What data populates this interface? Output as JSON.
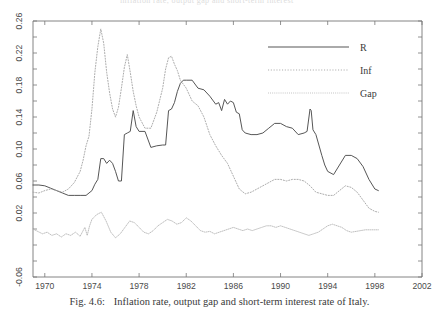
{
  "figure": {
    "caption_number": "Fig. 4.6:",
    "caption_text": "Inflation rate, output gap and short-term interest rate of Italy.",
    "top_bleed_text": "inflation rate, output gap and short-term interest"
  },
  "chart_data": {
    "type": "line",
    "title": "",
    "xlabel": "",
    "ylabel": "",
    "xlim": [
      1969,
      2002
    ],
    "ylim": [
      -0.06,
      0.26
    ],
    "grid": false,
    "legend_position": "top-right",
    "xticks": [
      1970,
      1974,
      1978,
      1982,
      1986,
      1990,
      1994,
      1998,
      2002
    ],
    "xtick_labels": [
      "1970",
      "1974",
      "1978",
      "1982",
      "1986",
      "1990",
      "1994",
      "1998",
      "2002"
    ],
    "yticks": [
      -0.06,
      -0.04,
      -0.02,
      0.0,
      0.02,
      0.04,
      0.06,
      0.08,
      0.1,
      0.12,
      0.14,
      0.16,
      0.18,
      0.2,
      0.22,
      0.24,
      0.26
    ],
    "ytick_labels": [
      "-0.06",
      "",
      "0.02",
      "",
      "0.06",
      "",
      "0.10",
      "",
      "0.14",
      "",
      "0.18",
      "",
      "0.22",
      "",
      "0.26"
    ],
    "ytick_labeled": [
      -0.06,
      0.02,
      0.06,
      0.1,
      0.14,
      0.18,
      0.22,
      0.26
    ],
    "series": [
      {
        "name": "R",
        "style": "solid",
        "color": "#4d4d4d",
        "x": [
          1969.0,
          1969.5,
          1970.0,
          1970.5,
          1971.0,
          1971.5,
          1972.0,
          1972.5,
          1973.0,
          1973.5,
          1974.0,
          1974.25,
          1974.5,
          1974.75,
          1975.0,
          1975.25,
          1975.5,
          1975.75,
          1976.0,
          1976.25,
          1976.5,
          1976.75,
          1977.0,
          1977.25,
          1977.5,
          1977.75,
          1978.0,
          1978.5,
          1979.0,
          1979.5,
          1980.0,
          1980.25,
          1980.5,
          1980.75,
          1981.0,
          1981.25,
          1981.5,
          1981.75,
          1982.0,
          1982.5,
          1983.0,
          1983.5,
          1984.0,
          1984.5,
          1984.75,
          1985.0,
          1985.25,
          1985.5,
          1985.75,
          1986.0,
          1986.25,
          1986.5,
          1986.75,
          1987.0,
          1987.5,
          1988.0,
          1988.5,
          1989.0,
          1989.5,
          1990.0,
          1990.5,
          1991.0,
          1991.5,
          1992.0,
          1992.25,
          1992.5,
          1992.6,
          1992.75,
          1993.0,
          1993.25,
          1993.5,
          1993.75,
          1994.0,
          1994.5,
          1995.0,
          1995.5,
          1996.0,
          1996.5,
          1997.0,
          1997.5,
          1998.0,
          1998.3
        ],
        "y": [
          0.055,
          0.055,
          0.054,
          0.051,
          0.048,
          0.045,
          0.042,
          0.042,
          0.042,
          0.042,
          0.048,
          0.056,
          0.062,
          0.088,
          0.088,
          0.082,
          0.086,
          0.082,
          0.072,
          0.06,
          0.06,
          0.118,
          0.12,
          0.122,
          0.148,
          0.128,
          0.122,
          0.122,
          0.102,
          0.104,
          0.105,
          0.105,
          0.148,
          0.15,
          0.158,
          0.172,
          0.182,
          0.186,
          0.186,
          0.186,
          0.176,
          0.174,
          0.166,
          0.156,
          0.158,
          0.148,
          0.162,
          0.156,
          0.16,
          0.158,
          0.146,
          0.144,
          0.124,
          0.12,
          0.118,
          0.118,
          0.12,
          0.126,
          0.132,
          0.132,
          0.128,
          0.126,
          0.118,
          0.12,
          0.122,
          0.15,
          0.148,
          0.124,
          0.118,
          0.105,
          0.092,
          0.08,
          0.072,
          0.068,
          0.08,
          0.092,
          0.092,
          0.088,
          0.078,
          0.062,
          0.05,
          0.048
        ]
      },
      {
        "name": "Inf",
        "style": "dashed",
        "color": "#a8a8a8",
        "x": [
          1969.0,
          1969.5,
          1970.0,
          1970.5,
          1971.0,
          1971.5,
          1972.0,
          1972.5,
          1973.0,
          1973.25,
          1973.5,
          1973.75,
          1974.0,
          1974.25,
          1974.5,
          1974.75,
          1975.0,
          1975.25,
          1975.5,
          1975.75,
          1976.0,
          1976.25,
          1976.5,
          1976.75,
          1977.0,
          1977.25,
          1977.5,
          1977.75,
          1978.0,
          1978.5,
          1979.0,
          1979.5,
          1980.0,
          1980.25,
          1980.5,
          1980.75,
          1981.0,
          1981.25,
          1981.5,
          1982.0,
          1982.5,
          1983.0,
          1983.5,
          1984.0,
          1984.5,
          1985.0,
          1985.5,
          1986.0,
          1986.5,
          1987.0,
          1987.5,
          1988.0,
          1988.5,
          1989.0,
          1989.5,
          1990.0,
          1990.5,
          1991.0,
          1991.5,
          1992.0,
          1992.5,
          1993.0,
          1993.5,
          1994.0,
          1994.5,
          1995.0,
          1995.5,
          1996.0,
          1996.5,
          1997.0,
          1997.5,
          1998.0,
          1998.3
        ],
        "y": [
          0.046,
          0.045,
          0.048,
          0.05,
          0.048,
          0.046,
          0.05,
          0.058,
          0.072,
          0.086,
          0.104,
          0.116,
          0.15,
          0.196,
          0.228,
          0.25,
          0.232,
          0.196,
          0.17,
          0.15,
          0.14,
          0.152,
          0.176,
          0.202,
          0.218,
          0.196,
          0.172,
          0.154,
          0.14,
          0.126,
          0.126,
          0.146,
          0.176,
          0.2,
          0.214,
          0.216,
          0.206,
          0.198,
          0.186,
          0.176,
          0.16,
          0.154,
          0.14,
          0.118,
          0.104,
          0.092,
          0.082,
          0.066,
          0.05,
          0.044,
          0.046,
          0.05,
          0.054,
          0.058,
          0.062,
          0.062,
          0.06,
          0.062,
          0.062,
          0.06,
          0.054,
          0.046,
          0.044,
          0.042,
          0.042,
          0.048,
          0.054,
          0.052,
          0.046,
          0.036,
          0.026,
          0.022,
          0.021
        ]
      },
      {
        "name": "Gap",
        "style": "dotted",
        "color": "#b4b4b4",
        "x": [
          1969.0,
          1969.4,
          1969.8,
          1970.2,
          1970.6,
          1971.0,
          1971.4,
          1971.8,
          1972.2,
          1972.6,
          1973.0,
          1973.4,
          1973.6,
          1973.8,
          1974.0,
          1974.4,
          1974.8,
          1975.2,
          1975.6,
          1976.0,
          1976.4,
          1976.8,
          1977.2,
          1977.6,
          1978.0,
          1978.4,
          1978.8,
          1979.2,
          1979.6,
          1980.0,
          1980.4,
          1980.8,
          1981.2,
          1981.6,
          1982.0,
          1982.4,
          1982.8,
          1983.2,
          1983.6,
          1984.0,
          1984.4,
          1984.8,
          1985.2,
          1985.6,
          1986.0,
          1986.4,
          1986.8,
          1987.2,
          1987.6,
          1988.0,
          1988.4,
          1988.8,
          1989.2,
          1989.6,
          1990.0,
          1990.4,
          1990.8,
          1991.2,
          1991.6,
          1992.0,
          1992.4,
          1992.8,
          1993.2,
          1993.6,
          1994.0,
          1994.4,
          1994.8,
          1995.2,
          1995.6,
          1996.0,
          1996.4,
          1996.8,
          1997.2,
          1997.6,
          1998.0,
          1998.3
        ],
        "y": [
          0.0,
          -0.003,
          -0.006,
          -0.004,
          -0.008,
          -0.006,
          -0.01,
          -0.006,
          -0.008,
          -0.004,
          -0.009,
          0.002,
          -0.008,
          0.004,
          0.012,
          0.018,
          0.021,
          0.01,
          -0.004,
          -0.011,
          -0.006,
          0.002,
          0.01,
          0.008,
          0.002,
          -0.004,
          -0.006,
          -0.002,
          0.004,
          0.008,
          0.012,
          0.01,
          0.006,
          0.008,
          0.014,
          0.01,
          0.004,
          -0.002,
          -0.004,
          -0.003,
          -0.006,
          -0.004,
          -0.002,
          0.0,
          0.002,
          0.0,
          -0.002,
          0.0,
          -0.002,
          0.0,
          0.002,
          0.004,
          0.004,
          0.002,
          0.004,
          0.002,
          0.0,
          -0.002,
          -0.004,
          -0.006,
          -0.008,
          -0.006,
          -0.004,
          0.0,
          0.004,
          0.006,
          0.004,
          0.002,
          -0.002,
          -0.004,
          -0.003,
          -0.002,
          -0.001,
          -0.001,
          -0.001,
          -0.001
        ]
      }
    ],
    "legend": [
      {
        "label": "R",
        "style": "solid"
      },
      {
        "label": "Inf",
        "style": "dashed"
      },
      {
        "label": "Gap",
        "style": "dotted"
      }
    ]
  }
}
